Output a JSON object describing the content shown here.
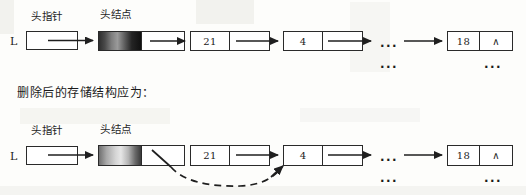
{
  "caption": {
    "text": "删除后的存储结构应为："
  },
  "diagrams": [
    {
      "name": "before-deletion",
      "pointer_label": "L",
      "annotations": {
        "head_pointer": "头指针",
        "head_node": "头结点"
      },
      "nodes": [
        {
          "data": "",
          "next": "",
          "kind": "head-node"
        },
        {
          "data": "21",
          "next": "",
          "kind": "node"
        },
        {
          "data": "4",
          "next": "",
          "kind": "node"
        },
        {
          "data": "18",
          "next": "∧",
          "kind": "tail-node"
        }
      ],
      "ellipsis_upper": "...",
      "ellipsis_lower": "...",
      "ellipsis_tail": "..."
    },
    {
      "name": "after-deletion",
      "pointer_label": "L",
      "annotations": {
        "head_pointer": "头指针",
        "head_node": "头结点"
      },
      "nodes": [
        {
          "data": "",
          "next": "",
          "kind": "head-node"
        },
        {
          "data": "21",
          "next": "",
          "kind": "node"
        },
        {
          "data": "4",
          "next": "",
          "kind": "node"
        },
        {
          "data": "18",
          "next": "∧",
          "kind": "tail-node"
        }
      ],
      "ellipsis_upper": "...",
      "ellipsis_lower": "...",
      "ellipsis_tail": "...",
      "dashed_link": "重新指向"
    }
  ],
  "colors": {
    "ink": "#1c1c1c",
    "paper": "#fdfdfb",
    "stroke": "#2a2a2a"
  }
}
